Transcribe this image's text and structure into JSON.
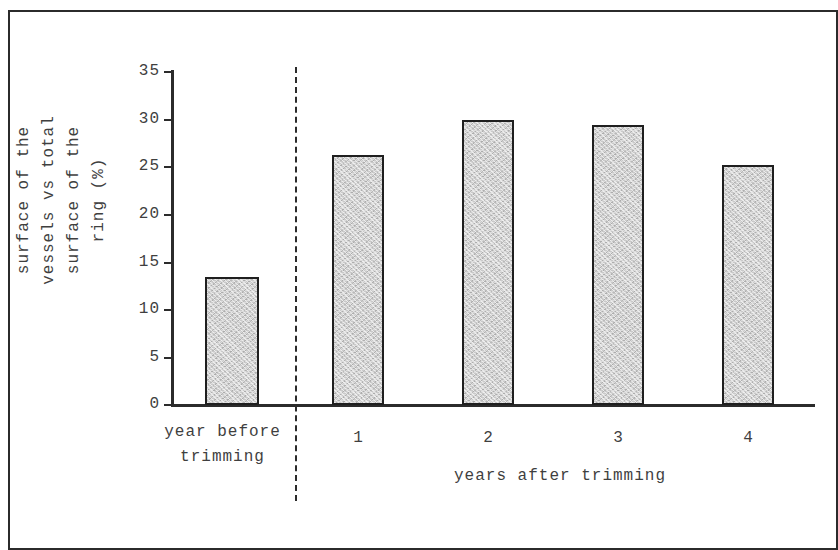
{
  "chart_data": {
    "type": "bar",
    "title": "",
    "subtitle": "",
    "xlabel": "years after trimming",
    "ylabel": "surface of the\nvessels vs total\nsurface of the\nring (%)",
    "categories": [
      "year before trimming",
      "1",
      "2",
      "3",
      "4"
    ],
    "values": [
      13.4,
      26.2,
      29.9,
      29.3,
      25.2
    ],
    "series": [
      {
        "name": "surface of the vessels vs total surface of the ring (%)",
        "values": [
          13.4,
          26.2,
          29.9,
          29.3,
          25.2
        ]
      }
    ],
    "ylim": [
      0,
      35
    ],
    "ytick_labels": [
      "0",
      "5",
      "10",
      "15",
      "20",
      "25",
      "30",
      "35"
    ],
    "ytick_values": [
      0,
      5,
      10,
      15,
      20,
      25,
      30,
      35
    ],
    "grid": false,
    "legend": "none",
    "group_separator": {
      "style": "dashed-vertical",
      "after_category_index": 0
    },
    "bar_fill_color": "#c9c9c9",
    "bar_edge_color": "#1f1f1f",
    "axis_color": "#2b2b2b",
    "background_color": "#ffffff"
  },
  "axis": {
    "y_title_lines": [
      "surface of the",
      "vessels vs total",
      "surface of the",
      "ring (%)"
    ],
    "x_title": "years after trimming",
    "ticks": [
      "35",
      "30",
      "25",
      "20",
      "15",
      "10",
      "5",
      "0"
    ]
  },
  "categories": {
    "before_label_lines": [
      "year",
      "before",
      "trimming"
    ],
    "after_labels": [
      "1",
      "2",
      "3",
      "4"
    ]
  }
}
